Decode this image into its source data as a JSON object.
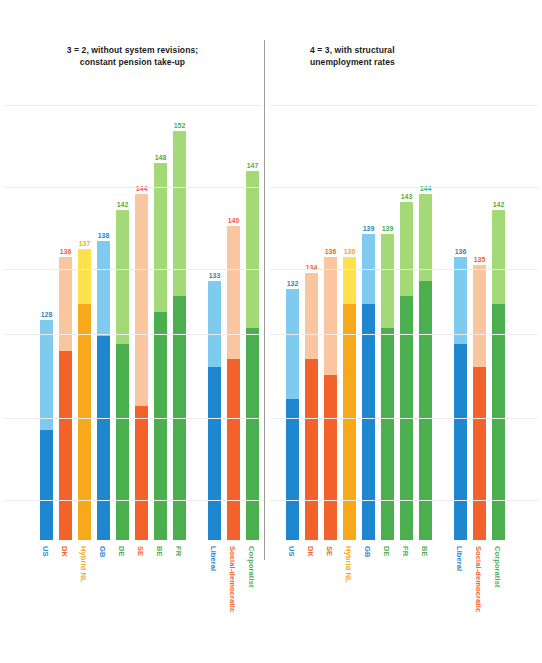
{
  "chart_data": {
    "type": "bar",
    "title": "",
    "subtitle": "",
    "xlabel": "",
    "ylabel": "",
    "grid": true,
    "legend": "none",
    "value_label_format": "integer",
    "ylim": [
      100,
      156
    ],
    "panels": [
      {
        "id": "panel-left",
        "title": "3 = 2, without system revisions;\nconstant pension take-up",
        "categories": [
          "US",
          "DK",
          "Hybrid NL",
          "GB",
          "DE",
          "SE",
          "BE",
          "FR",
          "Liberal",
          "Social-democratic",
          "Corporatist"
        ],
        "values": [
          128,
          136,
          137,
          138,
          142,
          144,
          148,
          152,
          133,
          140,
          147
        ],
        "split_values": [
          114,
          124,
          130,
          126,
          125,
          117,
          129,
          131,
          122,
          123,
          127
        ],
        "colors": [
          "blue",
          "orange",
          "amber",
          "blue",
          "green",
          "orange",
          "green",
          "green",
          "blue",
          "orange",
          "green"
        ],
        "group_gap_after_index": 7
      },
      {
        "id": "panel-right",
        "title": "4 = 3, with structural\nunemployment rates",
        "categories": [
          "US",
          "DK",
          "SE",
          "Hybrid NL",
          "GB",
          "DE",
          "FR",
          "BE",
          "Liberal",
          "Social-democratic",
          "Corporatist"
        ],
        "values": [
          132,
          134,
          136,
          136,
          139,
          139,
          143,
          144,
          136,
          135,
          142
        ],
        "split_values": [
          118,
          123,
          121,
          130,
          130,
          127,
          131,
          133,
          125,
          122,
          130
        ],
        "colors": [
          "blue",
          "orange",
          "orange",
          "amber",
          "blue",
          "green",
          "green",
          "green",
          "blue",
          "orange",
          "green"
        ],
        "group_gap_after_index": 7
      }
    ],
    "palette": {
      "blue_dark": "#1f87cf",
      "blue_light": "#7ecbef",
      "orange_dark": "#f2622a",
      "orange_light": "#fac69f",
      "amber_dark": "#f7a81b",
      "amber_light": "#ffe14d",
      "green_dark": "#4caf4f",
      "green_light": "#a3da77",
      "gridline": "#ececec",
      "divider": "#9a9a9a",
      "title_text": "#1a1a1a"
    },
    "gridlines_y": [
      105,
      187,
      269,
      334,
      418,
      500
    ]
  }
}
